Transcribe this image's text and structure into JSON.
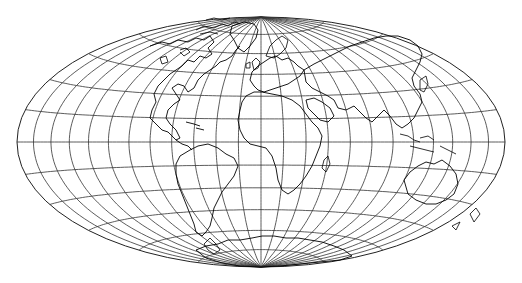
{
  "map": {
    "projection": "Hammer-Aitoff (equal-area, elliptical)",
    "graticule_spacing_deg": 15,
    "canvas": {
      "width": 522,
      "height": 283
    },
    "ellipse": {
      "cx": 261,
      "cy": 142,
      "rx": 244,
      "ry": 125
    },
    "colors": {
      "background": "#ffffff",
      "outline": "#222222",
      "graticule": "#333333",
      "coastline": "#000000"
    },
    "features": [
      "North America",
      "South America",
      "Europe",
      "Africa",
      "Asia",
      "Australia",
      "Antarctica",
      "Greenland",
      "Arctic islands"
    ]
  }
}
